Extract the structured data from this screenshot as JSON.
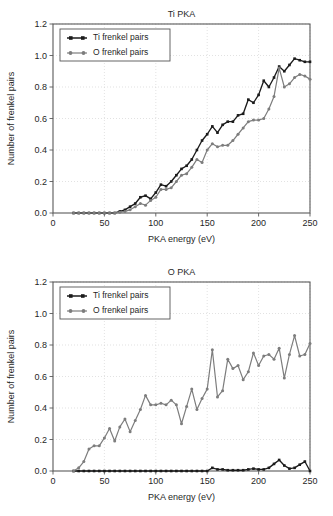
{
  "figure": {
    "width": 333,
    "height": 516,
    "background": "#ffffff",
    "panels": 2
  },
  "colors": {
    "ti_series": "#1b1b1b",
    "o_series": "#7d7d7d",
    "axis": "#5a5a5a",
    "grid": "#cfcfcf",
    "text": "#1f1f1f"
  },
  "legend": {
    "ti_label": "Ti frenkel pairs",
    "o_label": "O frenkel pairs",
    "position": "upper left"
  },
  "chart_data": [
    {
      "id": "ti-pka",
      "type": "line",
      "title": "Ti PKA",
      "xlabel": "PKA energy (eV)",
      "ylabel": "Number of frenkel pairs",
      "xlim": [
        0,
        250
      ],
      "ylim": [
        0.0,
        1.2
      ],
      "xticks": [
        0,
        50,
        100,
        150,
        200,
        250
      ],
      "yticks": [
        "0.0",
        "0.2",
        "0.4",
        "0.6",
        "0.8",
        "1.0",
        "1.2"
      ],
      "ytick_values": [
        0.0,
        0.2,
        0.4,
        0.6,
        0.8,
        1.0,
        1.2
      ],
      "grid": true,
      "legend_position": "upper left",
      "series": [
        {
          "name": "Ti frenkel pairs",
          "color": "#1b1b1b",
          "marker": "square",
          "x": [
            20,
            25,
            30,
            35,
            40,
            45,
            50,
            55,
            60,
            65,
            70,
            75,
            80,
            85,
            90,
            95,
            100,
            105,
            110,
            115,
            120,
            125,
            130,
            135,
            140,
            145,
            150,
            155,
            160,
            165,
            170,
            175,
            180,
            185,
            190,
            195,
            200,
            205,
            210,
            215,
            220,
            225,
            230,
            235,
            240,
            245,
            250
          ],
          "values": [
            0.0,
            0.0,
            0.0,
            0.0,
            0.0,
            0.0,
            0.0,
            0.0,
            0.0,
            0.01,
            0.02,
            0.04,
            0.06,
            0.1,
            0.11,
            0.09,
            0.13,
            0.18,
            0.17,
            0.2,
            0.24,
            0.28,
            0.3,
            0.34,
            0.4,
            0.46,
            0.5,
            0.55,
            0.51,
            0.56,
            0.58,
            0.58,
            0.62,
            0.63,
            0.72,
            0.7,
            0.75,
            0.84,
            0.8,
            0.86,
            0.93,
            0.9,
            0.94,
            0.98,
            0.97,
            0.96,
            0.96
          ]
        },
        {
          "name": "O frenkel pairs",
          "color": "#7d7d7d",
          "marker": "circle",
          "x": [
            20,
            25,
            30,
            35,
            40,
            45,
            50,
            55,
            60,
            65,
            70,
            75,
            80,
            85,
            90,
            95,
            100,
            105,
            110,
            115,
            120,
            125,
            130,
            135,
            140,
            145,
            150,
            155,
            160,
            165,
            170,
            175,
            180,
            185,
            190,
            195,
            200,
            205,
            210,
            215,
            220,
            225,
            230,
            235,
            240,
            245,
            250
          ],
          "values": [
            0.0,
            0.0,
            0.0,
            0.0,
            0.0,
            0.0,
            0.0,
            0.0,
            0.0,
            0.005,
            0.01,
            0.02,
            0.04,
            0.06,
            0.05,
            0.08,
            0.1,
            0.15,
            0.15,
            0.16,
            0.2,
            0.24,
            0.25,
            0.29,
            0.34,
            0.32,
            0.4,
            0.44,
            0.42,
            0.43,
            0.43,
            0.46,
            0.5,
            0.54,
            0.58,
            0.59,
            0.59,
            0.6,
            0.66,
            0.74,
            0.92,
            0.8,
            0.82,
            0.86,
            0.88,
            0.87,
            0.85
          ]
        }
      ]
    },
    {
      "id": "o-pka",
      "type": "line",
      "title": "O PKA",
      "xlabel": "PKA energy (eV)",
      "ylabel": "Number of frenkel pairs",
      "xlim": [
        0,
        250
      ],
      "ylim": [
        0.0,
        1.2
      ],
      "xticks": [
        0,
        50,
        100,
        150,
        200,
        250
      ],
      "yticks": [
        "0.0",
        "0.2",
        "0.4",
        "0.6",
        "0.8",
        "1.0",
        "1.2"
      ],
      "ytick_values": [
        0.0,
        0.2,
        0.4,
        0.6,
        0.8,
        1.0,
        1.2
      ],
      "grid": true,
      "legend_position": "upper left",
      "series": [
        {
          "name": "Ti frenkel pairs",
          "color": "#1b1b1b",
          "marker": "square",
          "x": [
            20,
            25,
            30,
            35,
            40,
            45,
            50,
            55,
            60,
            65,
            70,
            75,
            80,
            85,
            90,
            95,
            100,
            105,
            110,
            115,
            120,
            125,
            130,
            135,
            140,
            145,
            150,
            155,
            160,
            165,
            170,
            175,
            180,
            185,
            190,
            195,
            200,
            205,
            210,
            215,
            220,
            225,
            230,
            235,
            240,
            245,
            250
          ],
          "values": [
            0.0,
            0.0,
            0.0,
            0.0,
            0.0,
            0.0,
            0.0,
            0.0,
            0.0,
            0.0,
            0.0,
            0.0,
            0.0,
            0.0,
            0.0,
            0.0,
            0.0,
            0.0,
            0.0,
            0.0,
            0.0,
            0.0,
            0.0,
            0.0,
            0.0,
            0.0,
            0.0,
            0.02,
            0.01,
            0.01,
            0.005,
            0.005,
            0.005,
            0.005,
            0.01,
            0.015,
            0.01,
            0.01,
            0.02,
            0.045,
            0.07,
            0.035,
            0.015,
            0.02,
            0.04,
            0.06,
            0.0
          ]
        },
        {
          "name": "O frenkel pairs",
          "color": "#7d7d7d",
          "marker": "circle",
          "x": [
            20,
            25,
            30,
            35,
            40,
            45,
            50,
            55,
            60,
            65,
            70,
            75,
            80,
            85,
            90,
            95,
            100,
            105,
            110,
            115,
            120,
            125,
            130,
            135,
            140,
            145,
            150,
            155,
            160,
            165,
            170,
            175,
            180,
            185,
            190,
            195,
            200,
            205,
            210,
            215,
            220,
            225,
            230,
            235,
            240,
            245,
            250
          ],
          "values": [
            0.0,
            0.02,
            0.06,
            0.14,
            0.16,
            0.16,
            0.21,
            0.27,
            0.19,
            0.28,
            0.33,
            0.25,
            0.32,
            0.39,
            0.48,
            0.42,
            0.42,
            0.43,
            0.42,
            0.45,
            0.42,
            0.3,
            0.41,
            0.52,
            0.39,
            0.46,
            0.52,
            0.77,
            0.47,
            0.51,
            0.71,
            0.65,
            0.67,
            0.58,
            0.63,
            0.75,
            0.67,
            0.73,
            0.74,
            0.71,
            0.78,
            0.59,
            0.74,
            0.86,
            0.73,
            0.74,
            0.81
          ]
        }
      ]
    }
  ]
}
